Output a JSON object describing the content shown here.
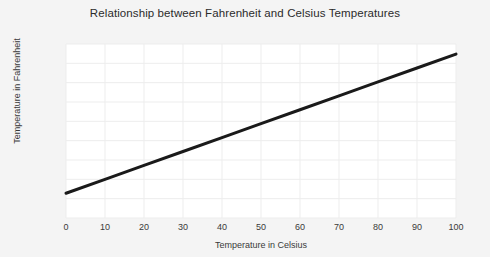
{
  "chart_data": {
    "type": "line",
    "title": "Relationship between Fahrenheit and Celsius Temperatures",
    "xlabel": "Temperature in Celsius",
    "ylabel": "Temperature in Fahrenheit",
    "xlim": [
      0,
      100
    ],
    "ylim": [
      0,
      225
    ],
    "xticks": [
      0,
      10,
      20,
      30,
      40,
      50,
      60,
      70,
      80,
      90,
      100
    ],
    "yticks": [
      0,
      25,
      50,
      75,
      100,
      125,
      150,
      175,
      200,
      225
    ],
    "xticklabels": [
      "0",
      "10",
      "20",
      "30",
      "40",
      "50",
      "60",
      "70",
      "80",
      "90",
      "100"
    ],
    "yticklabels": [
      "0",
      "25",
      "50",
      "75",
      "100",
      "125",
      "150",
      "175",
      "200",
      "225"
    ],
    "grid": true,
    "legend": false,
    "series": [
      {
        "name": "Fahrenheit = 1.8 x Celsius + 32",
        "color": "#1a1a1a",
        "linewidth": 3,
        "x": [
          0,
          10,
          20,
          30,
          40,
          50,
          60,
          70,
          80,
          90,
          100
        ],
        "values": [
          32,
          50,
          68,
          86,
          104,
          122,
          140,
          158,
          176,
          194,
          212
        ]
      }
    ],
    "colors": {
      "line": "#1a1a1a",
      "grid": "#ededed",
      "plot_background": "#ffffff",
      "figure_background": "#f4f4f4",
      "text": "#3a3a3a",
      "title_text": "#2b2b2b"
    }
  }
}
